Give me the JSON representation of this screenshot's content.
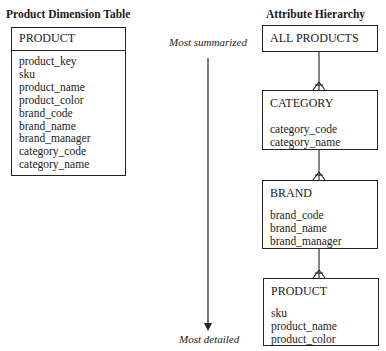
{
  "left": {
    "title": "Product Dimension Table",
    "table": {
      "name": "PRODUCT",
      "attributes": [
        "product_key",
        "sku",
        "product_name",
        "product_color",
        "brand_code",
        "brand_name",
        "brand_manager",
        "category_code",
        "category_name"
      ]
    }
  },
  "right": {
    "title": "Attribute Hierarchy",
    "axis": {
      "top_label": "Most summarized",
      "bottom_label": "Most detailed"
    },
    "levels": [
      {
        "name": "ALL PRODUCTS",
        "attributes": []
      },
      {
        "name": "CATEGORY",
        "attributes": [
          "category_code",
          "category_name"
        ]
      },
      {
        "name": "BRAND",
        "attributes": [
          "brand_code",
          "brand_name",
          "brand_manager"
        ]
      },
      {
        "name": "PRODUCT",
        "attributes": [
          "sku",
          "product_name",
          "product_color"
        ]
      }
    ]
  }
}
